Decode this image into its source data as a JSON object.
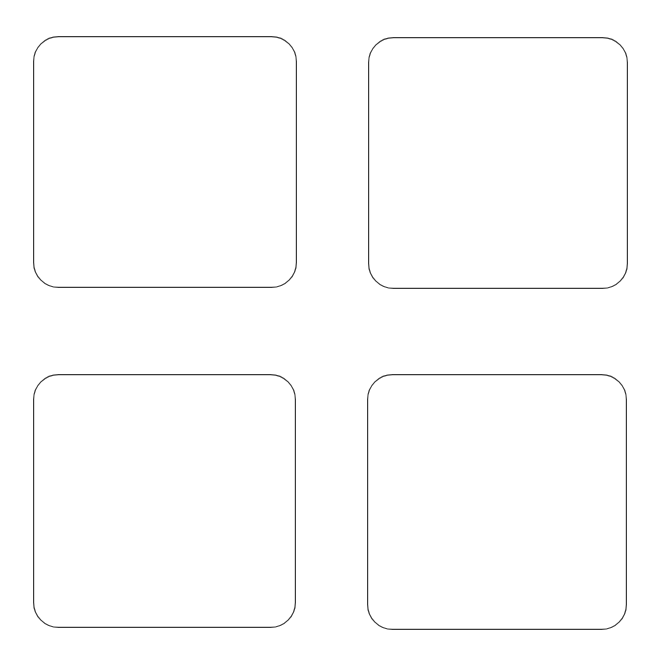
{
  "canvas": {
    "width": 659,
    "height": 658,
    "background_color": "#ffffff",
    "description": "Blank 2x2 grid of empty rounded-square panels on a white background"
  },
  "style": {
    "stroke_color": "#3a3a3a",
    "stroke_width": 1,
    "corner_radius": 25,
    "fill_color": "#ffffff"
  },
  "layout": {
    "columns": 2,
    "rows": 2,
    "horizontal_gutter": 71,
    "vertical_gutter": 86,
    "left_margin": 33,
    "top_margin": 36,
    "right_margin": 31,
    "bottom_margin": 28
  },
  "panels": [
    {
      "id": "panel-top-left",
      "label": "",
      "content": "",
      "x": 33,
      "y": 36,
      "width": 264,
      "height": 252,
      "row": 1,
      "column": 1
    },
    {
      "id": "panel-top-right",
      "label": "",
      "content": "",
      "x": 368,
      "y": 37,
      "width": 260,
      "height": 252,
      "row": 1,
      "column": 2
    },
    {
      "id": "panel-bottom-left",
      "label": "",
      "content": "",
      "x": 33,
      "y": 374,
      "width": 263,
      "height": 254,
      "row": 2,
      "column": 1
    },
    {
      "id": "panel-bottom-right",
      "label": "",
      "content": "",
      "x": 367,
      "y": 374,
      "width": 260,
      "height": 256,
      "row": 2,
      "column": 2
    }
  ]
}
